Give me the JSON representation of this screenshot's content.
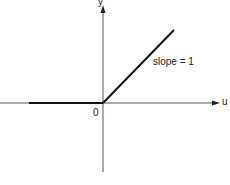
{
  "diagram": {
    "type": "piecewise-linear function graph (ramp / ReLU)",
    "axes": {
      "x_label": "u",
      "y_label": "y",
      "origin_label": "0"
    },
    "function": {
      "segments": [
        {
          "name": "flat-segment",
          "description": "y = 0 for u < 0",
          "slope": 0
        },
        {
          "name": "ramp-segment",
          "description": "y = u for u >= 0",
          "slope": 1
        }
      ]
    },
    "annotation": "slope = 1",
    "colors": {
      "axis": "#555555",
      "curve": "#111111",
      "background": "#ffffff"
    }
  }
}
